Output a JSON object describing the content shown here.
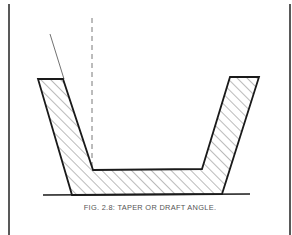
{
  "figure": {
    "caption": "FIG. 2.8: TAPER OR DRAFT ANGLE.",
    "colors": {
      "line": "#1a1a1a",
      "hatch": "#555555",
      "caption": "#555555",
      "background": "#ffffff"
    },
    "elements": {
      "vertical_reference_line": "dashed",
      "draft_angle_line": "thin solid",
      "hatched_section": "diagonal hatching",
      "base_line": "solid"
    }
  }
}
